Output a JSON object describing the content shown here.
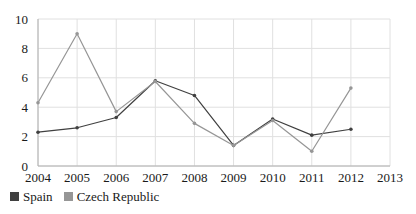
{
  "chart_data": {
    "type": "line",
    "title": "",
    "subtitle": "",
    "xlabel": "",
    "ylabel": "",
    "x": [
      2004,
      2005,
      2006,
      2007,
      2008,
      2009,
      2010,
      2011,
      2012,
      2013
    ],
    "categories": [
      "2004",
      "2005",
      "2006",
      "2007",
      "2008",
      "2009",
      "2010",
      "2011",
      "2012",
      "2013"
    ],
    "xlim": [
      2004,
      2013
    ],
    "ylim": [
      0,
      10
    ],
    "ytick_values": [
      0,
      2,
      4,
      6,
      8,
      10
    ],
    "ytick_labels": [
      "0",
      "2",
      "4",
      "6",
      "8",
      "10"
    ],
    "grid": true,
    "grid_color": "#e0e0e0",
    "legend_position": "below-left",
    "markers": "circle",
    "series": [
      {
        "name": "Spain",
        "color": "#404040",
        "x": [
          2004,
          2005,
          2006,
          2007,
          2008,
          2009,
          2010,
          2011,
          2012
        ],
        "values": [
          2.3,
          2.6,
          3.3,
          5.8,
          4.8,
          1.4,
          3.2,
          2.1,
          2.5
        ]
      },
      {
        "name": "Czech Republic",
        "color": "#969696",
        "x": [
          2004,
          2005,
          2006,
          2007,
          2008,
          2009,
          2010,
          2011,
          2012
        ],
        "values": [
          4.3,
          9.0,
          3.7,
          5.75,
          2.9,
          1.4,
          3.1,
          1.0,
          5.3
        ]
      }
    ]
  },
  "axes": {
    "y_labels": [
      "10",
      "8",
      "6",
      "4",
      "2",
      "0"
    ],
    "x_labels": [
      "2004",
      "2005",
      "2006",
      "2007",
      "2008",
      "2009",
      "2010",
      "2011",
      "2012",
      "2013"
    ]
  },
  "legend": {
    "items": [
      {
        "label": "Spain",
        "color": "#404040"
      },
      {
        "label": "Czech Republic",
        "color": "#969696"
      }
    ]
  }
}
